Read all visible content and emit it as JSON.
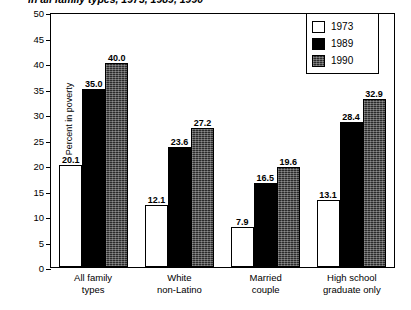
{
  "chart_data": {
    "type": "bar",
    "title": "in all family types, 1973, 1989, 1990",
    "xlabel": "",
    "ylabel": "Percent in poverty",
    "ylim": [
      0,
      50
    ],
    "yticks": [
      50,
      45,
      40,
      35,
      30,
      25,
      20,
      15,
      10,
      5,
      0
    ],
    "grid": false,
    "legend_position": "top-right",
    "categories": [
      "All family\ntypes",
      "White\nnon-Latino",
      "Married\ncouple",
      "High school\ngraduate only"
    ],
    "categories_display": [
      {
        "line1": "All family",
        "line2": "types"
      },
      {
        "line1": "White",
        "line2": "non-Latino"
      },
      {
        "line1": "Married",
        "line2": "couple"
      },
      {
        "line1": "High school",
        "line2": "graduate only"
      }
    ],
    "series": [
      {
        "name": "1973",
        "color": "#ffffff",
        "values": [
          20.1,
          12.1,
          7.9,
          13.1
        ]
      },
      {
        "name": "1989",
        "color": "#000000",
        "values": [
          35.0,
          23.6,
          16.5,
          28.4
        ]
      },
      {
        "name": "1990",
        "color": "#2b2b2b",
        "values": [
          40.0,
          27.2,
          19.6,
          32.9
        ]
      }
    ],
    "data_labels": [
      [
        "20.1",
        "35.0",
        "40.0"
      ],
      [
        "12.1",
        "23.6",
        "27.2"
      ],
      [
        "7.9",
        "16.5",
        "19.6"
      ],
      [
        "13.1",
        "28.4",
        "32.9"
      ]
    ]
  },
  "legend": {
    "items": [
      {
        "label": "1973",
        "swatch": "s1973"
      },
      {
        "label": "1989",
        "swatch": "s1989"
      },
      {
        "label": "1990",
        "swatch": "s1990"
      }
    ]
  }
}
